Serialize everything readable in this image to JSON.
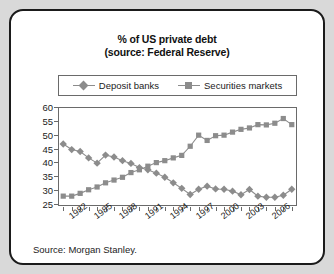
{
  "figure": {
    "title_line1": "% of US private debt",
    "title_line2": "(source: Federal Reserve)",
    "source_note": "Source: Morgan Stanley.",
    "border_color": "#1b1b1b",
    "background_color": "#d9d9d9",
    "card_color": "#ffffff",
    "series_color": "#8c8c8c",
    "axis_color": "#6a6a6a"
  },
  "chart_data": {
    "type": "line",
    "title": "% of US private debt (source: Federal Reserve)",
    "subtitle": "(source: Federal Reserve)",
    "xlabel": "",
    "ylabel": "",
    "ylim": [
      25,
      60
    ],
    "ytick_step": 5,
    "yticks": [
      25,
      30,
      35,
      40,
      45,
      50,
      55,
      60
    ],
    "grid": false,
    "legend_position": "top",
    "x": [
      1981,
      1982,
      1983,
      1984,
      1985,
      1986,
      1987,
      1988,
      1989,
      1990,
      1991,
      1992,
      1993,
      1994,
      1995,
      1996,
      1997,
      1998,
      1999,
      2000,
      2001,
      2002,
      2003,
      2004,
      2005,
      2006,
      2007,
      2008
    ],
    "xtick_labels": [
      "1982",
      "1985",
      "1988",
      "1991",
      "1994",
      "1997",
      "2000",
      "2003",
      "2006"
    ],
    "xtick_label_years": [
      1982,
      1985,
      1988,
      1991,
      1994,
      1997,
      2000,
      2003,
      2006
    ],
    "series": [
      {
        "name": "Deposit banks",
        "marker": "diamond",
        "color": "#8c8c8c",
        "values": [
          47.0,
          45.0,
          44.3,
          42.0,
          40.1,
          43.0,
          42.3,
          41.0,
          40.0,
          38.5,
          37.7,
          36.5,
          35.0,
          33.0,
          31.0,
          28.8,
          30.7,
          31.8,
          30.8,
          30.7,
          30.0,
          28.7,
          30.6,
          28.2,
          27.8,
          27.8,
          28.5,
          30.7
        ]
      },
      {
        "name": "Securities markets",
        "marker": "square",
        "color": "#8c8c8c",
        "values": [
          28.2,
          28.2,
          29.2,
          30.5,
          31.5,
          33.0,
          34.0,
          35.0,
          36.7,
          37.7,
          39.0,
          40.3,
          41.0,
          42.0,
          42.9,
          46.2,
          50.2,
          48.3,
          50.0,
          50.2,
          51.3,
          52.3,
          52.8,
          54.0,
          53.9,
          54.5,
          56.2,
          54.0
        ]
      }
    ]
  }
}
